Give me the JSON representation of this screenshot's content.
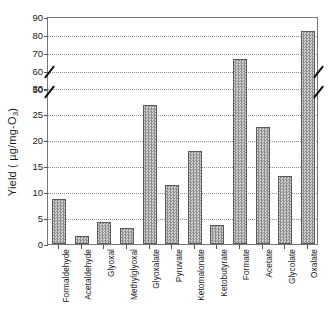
{
  "chart_data": {
    "type": "bar",
    "title": "",
    "xlabel": "",
    "ylabel": "Yield ( µg/mg-O",
    "ylabel_sub": "3",
    "ylabel_suffix": ")",
    "categories": [
      "Formaldehyde",
      "Acetaldehyde",
      "Glyoxal",
      "Methylglyoxal",
      "Glyoxalate",
      "Pyruvate",
      "Ketomalonate",
      "Ketobutyrate",
      "Formate",
      "Acetate",
      "Glycolate",
      "Oxalate"
    ],
    "values": [
      8.7,
      1.5,
      4.2,
      3.1,
      26.8,
      11.3,
      17.9,
      3.7,
      65.5,
      22.5,
      13.1,
      81.0
    ],
    "axis_break": true,
    "lower_axis": {
      "ylim": [
        0,
        30
      ],
      "ticks": [
        0,
        5,
        10,
        15,
        20,
        25,
        30
      ],
      "ticklabels": [
        "0",
        "5",
        "10",
        "15",
        "20",
        "25",
        "30"
      ]
    },
    "upper_axis": {
      "ylim": [
        50,
        90
      ],
      "ticks": [
        50,
        60,
        70,
        80,
        90
      ],
      "ticklabels": [
        "50",
        "60",
        "70",
        "80",
        "90"
      ]
    },
    "grid": true,
    "legend": "none",
    "bar_fill": "#b8b8b8",
    "bar_edge": "#5a5a5a",
    "grid_color": "#8c8c8c",
    "axis_color": "#777777"
  }
}
